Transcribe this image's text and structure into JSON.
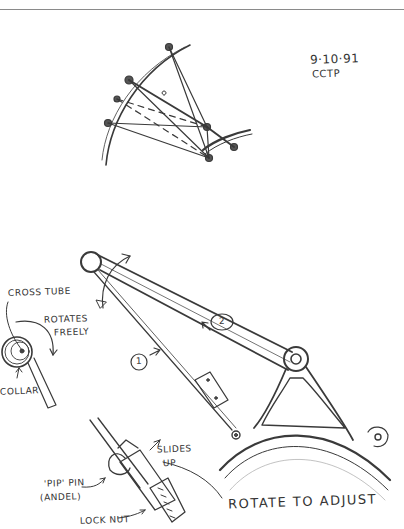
{
  "sketch": {
    "title_block": {
      "date": "9·10·91",
      "initials": "CCTP"
    },
    "labels": {
      "cross_tube": "CROSS TUBE",
      "rotates_freely": [
        "ROTATES",
        "FREELY"
      ],
      "collar": "COLLAR",
      "member_1": "1",
      "member_2": "2",
      "slides_up": [
        "SLIDES",
        "UP"
      ],
      "pip_pin": [
        "'PIP' PIN",
        "(ANDEL)"
      ],
      "lock_nut": "LOCK NUT",
      "rotate_to_adjust": "ROTATE TO ADJUST"
    },
    "colors": {
      "ink": "#333333",
      "paper": "#ffffff",
      "rule": "#8a8a8a"
    }
  }
}
